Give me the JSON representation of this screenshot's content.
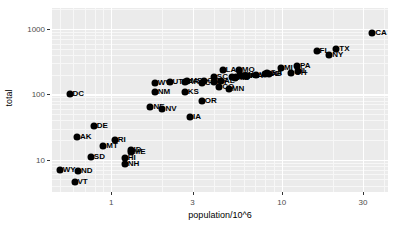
{
  "chart_data": {
    "type": "scatter",
    "title": "",
    "xlabel": "population/10^6",
    "ylabel": "total",
    "xscale": "log",
    "yscale": "log",
    "xlim": [
      0.45,
      42
    ],
    "ylim": [
      3.2,
      2100
    ],
    "grid": true,
    "legend": "none",
    "xticks": [
      {
        "value": 1,
        "label": "1"
      },
      {
        "value": 3,
        "label": "3"
      },
      {
        "value": 10,
        "label": "10"
      },
      {
        "value": 30,
        "label": "30"
      }
    ],
    "yticks": [
      {
        "value": 10,
        "label": "10"
      },
      {
        "value": 100,
        "label": "100"
      },
      {
        "value": 1000,
        "label": "1000"
      }
    ],
    "point_label_field": "state",
    "points": [
      {
        "state": "CA",
        "x": 33.9,
        "y": 860
      },
      {
        "state": "TX",
        "x": 20.9,
        "y": 500
      },
      {
        "state": "NY",
        "x": 19.0,
        "y": 405
      },
      {
        "state": "FL",
        "x": 16.0,
        "y": 455
      },
      {
        "state": "PA",
        "x": 12.3,
        "y": 275
      },
      {
        "state": "IL",
        "x": 12.4,
        "y": 225
      },
      {
        "state": "OH",
        "x": 11.4,
        "y": 215
      },
      {
        "state": "MI",
        "x": 9.9,
        "y": 250
      },
      {
        "state": "NJ",
        "x": 8.4,
        "y": 205
      },
      {
        "state": "GA",
        "x": 8.2,
        "y": 210
      },
      {
        "state": "NC",
        "x": 8.0,
        "y": 205
      },
      {
        "state": "VA",
        "x": 7.1,
        "y": 200
      },
      {
        "state": "MA",
        "x": 6.3,
        "y": 190
      },
      {
        "state": "IN",
        "x": 6.1,
        "y": 190
      },
      {
        "state": "WA",
        "x": 5.9,
        "y": 190
      },
      {
        "state": "TN",
        "x": 5.7,
        "y": 195
      },
      {
        "state": "MO",
        "x": 5.6,
        "y": 235
      },
      {
        "state": "WI",
        "x": 5.4,
        "y": 185
      },
      {
        "state": "MD",
        "x": 5.3,
        "y": 180
      },
      {
        "state": "AZ",
        "x": 5.1,
        "y": 185
      },
      {
        "state": "MN",
        "x": 4.9,
        "y": 120
      },
      {
        "state": "LA",
        "x": 4.5,
        "y": 235
      },
      {
        "state": "AL",
        "x": 4.4,
        "y": 160
      },
      {
        "state": "CO",
        "x": 4.3,
        "y": 128
      },
      {
        "state": "KY",
        "x": 4.0,
        "y": 155
      },
      {
        "state": "SC",
        "x": 4.0,
        "y": 185
      },
      {
        "state": "OK",
        "x": 3.5,
        "y": 160
      },
      {
        "state": "OR",
        "x": 3.4,
        "y": 80
      },
      {
        "state": "CT",
        "x": 3.4,
        "y": 150
      },
      {
        "state": "IA",
        "x": 2.9,
        "y": 45
      },
      {
        "state": "MS",
        "x": 2.8,
        "y": 160
      },
      {
        "state": "AR",
        "x": 2.7,
        "y": 155
      },
      {
        "state": "KS",
        "x": 2.7,
        "y": 110
      },
      {
        "state": "UT",
        "x": 2.2,
        "y": 155
      },
      {
        "state": "NV",
        "x": 2.0,
        "y": 60
      },
      {
        "state": "NM",
        "x": 1.8,
        "y": 110
      },
      {
        "state": "NE",
        "x": 1.7,
        "y": 65
      },
      {
        "state": "WV",
        "x": 1.8,
        "y": 150
      },
      {
        "state": "ID",
        "x": 1.3,
        "y": 14
      },
      {
        "state": "ME",
        "x": 1.3,
        "y": 13
      },
      {
        "state": "NH",
        "x": 1.2,
        "y": 8.5
      },
      {
        "state": "HI",
        "x": 1.2,
        "y": 10.5
      },
      {
        "state": "RI",
        "x": 1.05,
        "y": 20
      },
      {
        "state": "MT",
        "x": 0.9,
        "y": 16
      },
      {
        "state": "DE",
        "x": 0.79,
        "y": 33
      },
      {
        "state": "SD",
        "x": 0.76,
        "y": 11
      },
      {
        "state": "AK",
        "x": 0.63,
        "y": 22
      },
      {
        "state": "ND",
        "x": 0.64,
        "y": 6.6
      },
      {
        "state": "VT",
        "x": 0.61,
        "y": 4.6
      },
      {
        "state": "WY",
        "x": 0.5,
        "y": 7.0
      },
      {
        "state": "DC",
        "x": 0.57,
        "y": 100
      }
    ]
  },
  "axis": {
    "x_title": "population/10^6",
    "y_title": "total"
  },
  "colors": {
    "panel_background": "#ebebeb",
    "grid_major": "#ffffff",
    "grid_minor": "#f7f7f7",
    "point": "#000000",
    "tick_text": "#4d4d4d",
    "axis_title": "#000000"
  }
}
